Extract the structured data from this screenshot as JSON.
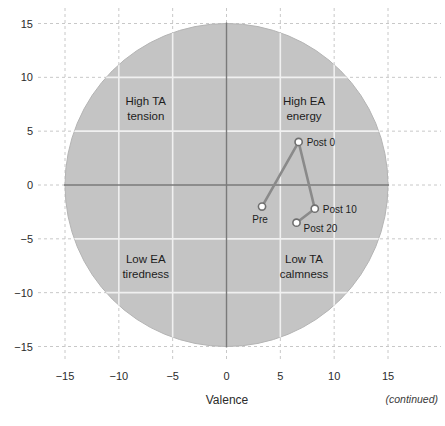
{
  "figure": {
    "footer_note": "(continued)",
    "background_color": "#ffffff"
  },
  "chart_data": {
    "type": "scatter",
    "title": "",
    "subtitle": "",
    "xlabel": "Valence",
    "ylabel": "",
    "xlim": [
      -16.5,
      16.5
    ],
    "ylim": [
      -16.5,
      16.5
    ],
    "xticks": [
      -15,
      -10,
      -5,
      0,
      5,
      10,
      15
    ],
    "xticklabels": [
      "−15",
      "−10",
      "−5",
      "0",
      "5",
      "10",
      "15"
    ],
    "yticks": [
      -15,
      -10,
      -5,
      0,
      5,
      10,
      15
    ],
    "yticklabels": [
      "−15",
      "−10",
      "−5",
      "0",
      "5",
      "10",
      "15"
    ],
    "grid": true,
    "grid_style": "dashed",
    "grid_color": "#c8c8c8",
    "legend": "none",
    "series": [
      {
        "name": "Mood trajectory",
        "marker": "open-circle",
        "line_color": "#8a8a8a",
        "marker_face": "#ffffff",
        "marker_edge": "#6f6f6f",
        "points": [
          {
            "label": "Pre",
            "x": 3.3,
            "y": -2.0,
            "label_pos": "below-left"
          },
          {
            "label": "Post 0",
            "x": 6.7,
            "y": 4.0,
            "label_pos": "right"
          },
          {
            "label": "Post 10",
            "x": 8.2,
            "y": -2.2,
            "label_pos": "right"
          },
          {
            "label": "Post 20",
            "x": 6.5,
            "y": -3.5,
            "label_pos": "below-right"
          }
        ]
      }
    ],
    "annotations": [
      {
        "name": "quadrant-upper-left",
        "line1": "High TA",
        "line2": "tension",
        "x": -7.5,
        "y": 7.4
      },
      {
        "name": "quadrant-upper-right",
        "line1": "High EA",
        "line2": "energy",
        "x": 7.2,
        "y": 7.4
      },
      {
        "name": "quadrant-lower-left",
        "line1": "Low EA",
        "line2": "tiredness",
        "x": -7.5,
        "y": -7.2
      },
      {
        "name": "quadrant-lower-right",
        "line1": "Low TA",
        "line2": "calmness",
        "x": 7.2,
        "y": -7.2
      }
    ],
    "circle": {
      "name": "circumplex-boundary",
      "center_x": 0,
      "center_y": 0,
      "radius": 15,
      "fill_color": "#c4c4c4",
      "stroke_color": "#b4b4b4"
    },
    "inner_grid_color": "#f0f0f0",
    "axis_line_color": "#7a7a7a"
  }
}
